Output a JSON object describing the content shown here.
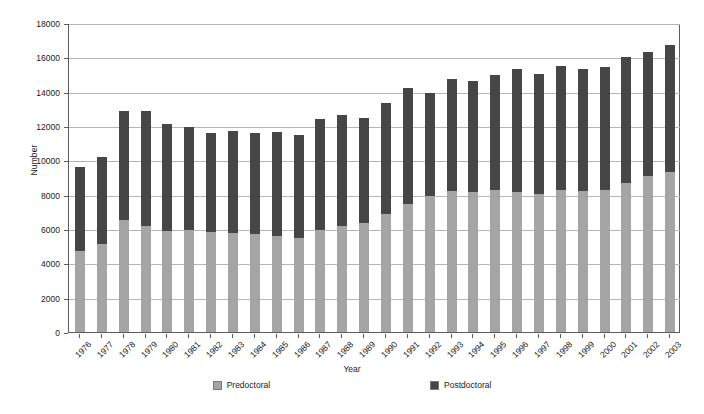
{
  "chart_data": {
    "type": "bar",
    "stacked": true,
    "title": "",
    "xlabel": "Year",
    "ylabel": "Number",
    "ylim": [
      0,
      18000
    ],
    "ytick_step": 2000,
    "yticks": [
      0,
      2000,
      4000,
      6000,
      8000,
      10000,
      12000,
      14000,
      16000,
      18000
    ],
    "grid": "horizontal",
    "legend_position": "bottom",
    "categories": [
      "1976",
      "1977",
      "1978",
      "1979",
      "1980",
      "1981",
      "1982",
      "1983",
      "1984",
      "1985",
      "1986",
      "1987",
      "1988",
      "1989",
      "1990",
      "1991",
      "1992",
      "1993",
      "1994",
      "1995",
      "1996",
      "1997",
      "1998",
      "1999",
      "2000",
      "2001",
      "2002",
      "2003"
    ],
    "series": [
      {
        "name": "Predoctoral",
        "color": "#a5a5a5",
        "values": [
          4700,
          5100,
          6500,
          6150,
          5900,
          5950,
          5800,
          5750,
          5700,
          5600,
          5500,
          5950,
          6200,
          6350,
          6900,
          7450,
          7950,
          8200,
          8150,
          8250,
          8150,
          8050,
          8300,
          8200,
          8250,
          8700,
          9100,
          9350
        ]
      },
      {
        "name": "Postdoctoral",
        "color": "#464646",
        "values": [
          4900,
          5100,
          6350,
          6750,
          6200,
          6000,
          5800,
          5950,
          5900,
          6050,
          5950,
          6450,
          6450,
          6100,
          6450,
          6750,
          5950,
          6550,
          6450,
          6750,
          7200,
          7000,
          7200,
          7150,
          7200,
          7300,
          7200,
          7350
        ]
      }
    ],
    "totals": [
      9600,
      10200,
      12850,
      12900,
      12100,
      11950,
      11600,
      11700,
      11600,
      11650,
      11450,
      12400,
      12650,
      12450,
      13350,
      14200,
      13900,
      14750,
      14600,
      15000,
      15350,
      15050,
      15500,
      15350,
      15450,
      16000,
      16300,
      16700
    ]
  },
  "legend": {
    "entries": [
      {
        "label": "Predoctoral",
        "color": "#a5a5a5"
      },
      {
        "label": "Postdoctoral",
        "color": "#464646"
      }
    ]
  },
  "axes": {
    "y_title": "Number",
    "x_title": "Year"
  }
}
